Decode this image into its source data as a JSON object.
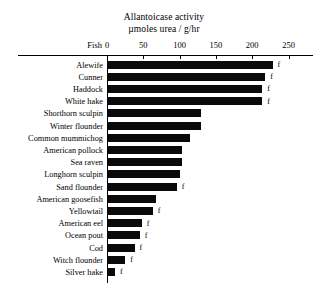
{
  "chart_data": {
    "type": "bar",
    "orientation": "horizontal",
    "title": "Allantoicase activity",
    "subtitle": "µmoles urea / g/hr",
    "xlabel": "",
    "ylabel": "Fish",
    "category_axis_label": "Fish",
    "xlim": [
      0,
      250
    ],
    "xticks": [
      0,
      50,
      100,
      150,
      200,
      250
    ],
    "xtick_labels": [
      "0",
      "50",
      "100",
      "150",
      "200",
      "250"
    ],
    "grid": false,
    "legend": null,
    "bar_color": "#0a0a0a",
    "annotation_symbol": "f",
    "categories": [
      "Alewife",
      "Cunner",
      "Haddock",
      "White hake",
      "Shorthorn sculpin",
      "Winter flounder",
      "Common mummichog",
      "American pollock",
      "Sea raven",
      "Longhorn sculpin",
      "Sand flounder",
      "American goosefish",
      "Yellowtail",
      "American eel",
      "Ocean pout",
      "Cod",
      "Witch flounder",
      "Silver hake"
    ],
    "values": [
      228,
      218,
      214,
      214,
      130,
      130,
      115,
      103,
      103,
      101,
      96,
      67,
      63,
      48,
      45,
      38,
      25,
      11
    ],
    "annotations": [
      {
        "category": "Alewife",
        "symbol": "f"
      },
      {
        "category": "Cunner",
        "symbol": "f"
      },
      {
        "category": "Haddock",
        "symbol": "f"
      },
      {
        "category": "White hake",
        "symbol": "f"
      },
      {
        "category": "Sand flounder",
        "symbol": "f"
      },
      {
        "category": "Yellowtail",
        "symbol": "f"
      },
      {
        "category": "American eel",
        "symbol": "f"
      },
      {
        "category": "Ocean pout",
        "symbol": "f"
      },
      {
        "category": "Cod",
        "symbol": "f"
      },
      {
        "category": "Witch flounder",
        "symbol": "f"
      },
      {
        "category": "Silver hake",
        "symbol": "f"
      }
    ]
  }
}
